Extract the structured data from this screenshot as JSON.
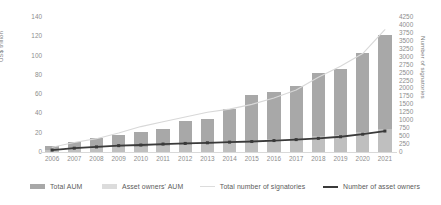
{
  "chart_data": {
    "type": "bar",
    "title": "",
    "subtitle": "",
    "xlabel": "",
    "ylabel": "US$ trillion",
    "y2label": "Number of signatories",
    "ylim": [
      0,
      140
    ],
    "y2lim": [
      0,
      4250
    ],
    "grid": false,
    "legend_position": "bottom",
    "categories": [
      "2006",
      "2007",
      "2008",
      "2009",
      "2010",
      "2011",
      "2012",
      "2013",
      "2014",
      "2015",
      "2016",
      "2017",
      "2018",
      "2019",
      "2020",
      "2021"
    ],
    "yticks_left": [
      "140",
      "120",
      "100",
      "80",
      "60",
      "40",
      "20",
      "0"
    ],
    "yticks_right": [
      "4250",
      "4000",
      "3750",
      "3500",
      "3250",
      "3000",
      "2750",
      "2500",
      "2250",
      "2000",
      "1750",
      "1500",
      "1250",
      "1000",
      "750",
      "500",
      "250",
      "0"
    ],
    "series": [
      {
        "name": "Total AUM",
        "type": "bar",
        "axis": "left",
        "unit": "US$ trillion",
        "color": "#a8a8a8",
        "values": [
          6.5,
          10,
          15,
          18,
          21,
          24,
          32,
          34,
          45,
          59,
          62,
          68,
          82,
          86,
          103,
          121
        ]
      },
      {
        "name": "Asset owners' AUM",
        "type": "bar",
        "axis": "left",
        "unit": "US$ trillion",
        "color": "#d2d2d2",
        "values": [
          2,
          3,
          4,
          5,
          5.5,
          6,
          7,
          8,
          10,
          12,
          13,
          14,
          17,
          18,
          21,
          24
        ]
      },
      {
        "name": "Total number of signatories",
        "type": "line",
        "axis": "right",
        "unit": "signatories",
        "color": "#d8d8d8",
        "values": [
          150,
          300,
          420,
          600,
          800,
          950,
          1100,
          1250,
          1350,
          1500,
          1700,
          1950,
          2350,
          2700,
          3100,
          3850
        ]
      },
      {
        "name": "Number of asset owners",
        "type": "line",
        "axis": "right",
        "unit": "signatories",
        "color": "#3a3a3a",
        "values": [
          60,
          120,
          160,
          200,
          220,
          250,
          270,
          290,
          310,
          330,
          360,
          390,
          430,
          480,
          560,
          660
        ]
      }
    ]
  },
  "legend": {
    "items": [
      {
        "label": "Total AUM",
        "marker": "bar",
        "color": "#a8a8a8"
      },
      {
        "label": "Asset owners' AUM",
        "marker": "bar",
        "color": "#d8d8d8"
      },
      {
        "label": "Total number of signatories",
        "marker": "line",
        "color": "#d8d8d8"
      },
      {
        "label": "Number of asset owners",
        "marker": "line",
        "color": "#3a3a3a"
      }
    ]
  }
}
